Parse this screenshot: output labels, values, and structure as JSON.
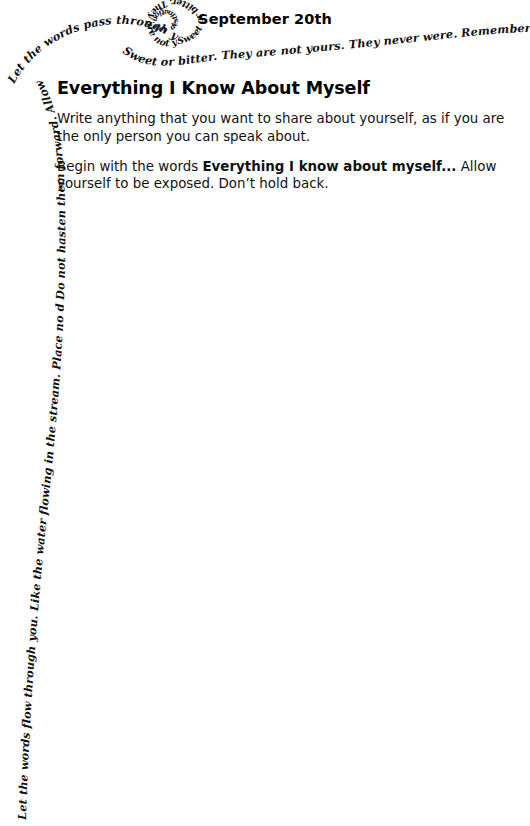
{
  "page": {
    "background_color": "#ffffff",
    "text_color": "#111111"
  },
  "header": {
    "date": "September 20th"
  },
  "main": {
    "title": "Everything I Know About Myself",
    "paragraphs": [
      {
        "id": "intro",
        "text": "Write anything that you want to share about yourself, as if you are the only person you can speak about."
      },
      {
        "id": "instruction",
        "lead": "Begin with the words ",
        "emphasis": "Everything I know about myself...",
        "tail": " Allow yourself to be exposed. Don’t hold back."
      }
    ]
  },
  "decoration": {
    "type": "handwritten-spiral",
    "ink_color": "#111111",
    "segments": [
      {
        "id": "outer-left",
        "text": "Let the words flow through you. Like the water flowing in the stream. Place no dam over your words. Do not ask them to slow down."
      },
      {
        "id": "outer-upper-left",
        "text": "Do not hasten them forward. Allow them to move freely. As they are."
      },
      {
        "id": "arc-top",
        "text": "Let the words pass through you. Peaceful and pleasant."
      },
      {
        "id": "arc-top-right",
        "text": "Sweet or bitter. They are not yours. They never were. Remember that all they want is to reach their"
      },
      {
        "id": "inner-loop",
        "text": "Sweet or bitter. They are not yours. They never were."
      },
      {
        "id": "inner-core",
        "text": "destination. Let them go."
      }
    ]
  }
}
